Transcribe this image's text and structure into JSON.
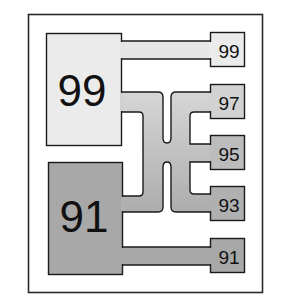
{
  "diagram": {
    "type": "blending-flow",
    "colors": {
      "background": "#ffffff",
      "frame": "#2a2a2a",
      "light_fill": "#ebebeb",
      "dark_fill": "#a8a8a8",
      "mid_fill": "#c2c2c2",
      "outline": "#1a1a1a"
    },
    "sources": [
      {
        "id": "source-99",
        "label": "99"
      },
      {
        "id": "source-91",
        "label": "91"
      }
    ],
    "outputs": [
      {
        "id": "out-99",
        "label": "99"
      },
      {
        "id": "out-97",
        "label": "97"
      },
      {
        "id": "out-95",
        "label": "95"
      },
      {
        "id": "out-93",
        "label": "93"
      },
      {
        "id": "out-91",
        "label": "91"
      }
    ]
  }
}
